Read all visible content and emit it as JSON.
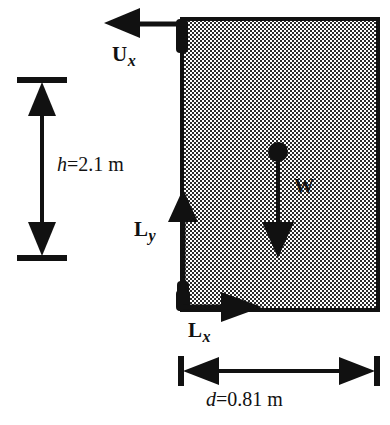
{
  "diagram": {
    "colors": {
      "stroke": "#111111",
      "fill_pattern": "#808080",
      "background": "#ffffff"
    },
    "body": {
      "name": "rectangular-block",
      "shape": "rectangle",
      "fill": "checkerboard-halftone-gray"
    },
    "forces": [
      {
        "id": "ux",
        "symbol": "U",
        "subscript": "x",
        "direction": "left",
        "applied_at": "top-left-corner"
      },
      {
        "id": "ly",
        "symbol": "L",
        "subscript": "y",
        "direction": "up",
        "applied_at": "left-edge"
      },
      {
        "id": "lx",
        "symbol": "L",
        "subscript": "x",
        "direction": "right",
        "applied_at": "bottom-left-corner"
      },
      {
        "id": "w",
        "symbol": "W",
        "subscript": "",
        "direction": "down",
        "applied_at": "center-of-gravity"
      }
    ],
    "dimensions": [
      {
        "id": "height",
        "symbol": "h",
        "equals": "=",
        "value": "2.1",
        "unit": "m",
        "text": "h = 2.1 m",
        "orientation": "vertical",
        "arrow_style": "double-headed-with-end-ticks"
      },
      {
        "id": "width",
        "symbol": "d",
        "equals": "=",
        "value": "0.81",
        "unit": "m",
        "text": "d = 0.81 m",
        "orientation": "horizontal",
        "arrow_style": "double-headed-with-end-ticks"
      }
    ]
  }
}
